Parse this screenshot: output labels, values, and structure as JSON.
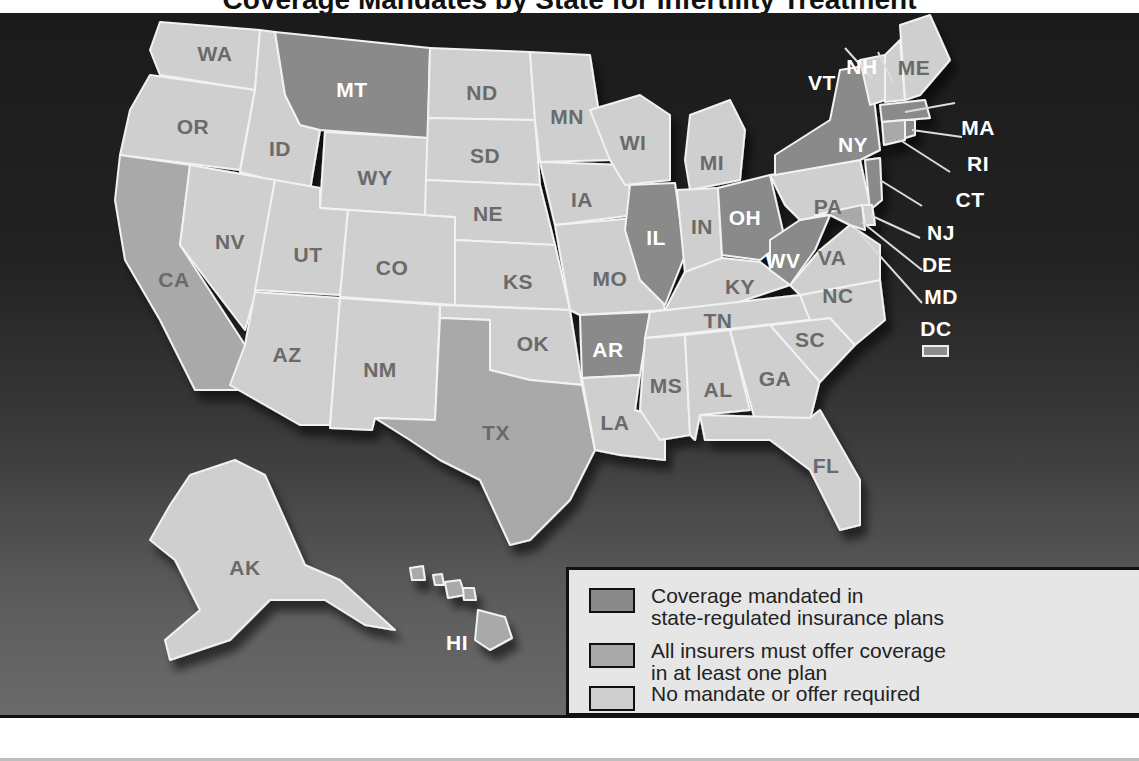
{
  "title": "Coverage Mandates by State for Infertility Treatment",
  "colors": {
    "mandated": "#8a8a8a",
    "offer": "#a9a9a9",
    "none": "#cfcfcf",
    "background_dark": "#1b1b1b",
    "legend_bg": "#e6e6e6"
  },
  "legend": {
    "items": [
      {
        "label": "Coverage mandated in state-regulated insurance plans",
        "line1": "Coverage mandated in",
        "line2": "state-regulated insurance plans",
        "category": "mandated"
      },
      {
        "label": "All insurers must offer coverage in at least one plan",
        "line1": "All insurers must offer coverage",
        "line2": "in at least one plan",
        "category": "offer"
      },
      {
        "label": "No mandate or offer required",
        "line1": "No mandate or offer required",
        "line2": "",
        "category": "none"
      }
    ]
  },
  "states": {
    "mandated": [
      "MT",
      "NY",
      "IL",
      "OH",
      "WV",
      "AR",
      "MA",
      "RI",
      "NJ"
    ],
    "offer": [
      "CA",
      "TX",
      "HI",
      "CT",
      "MD"
    ],
    "none": [
      "WA",
      "OR",
      "ID",
      "NV",
      "UT",
      "AZ",
      "WY",
      "CO",
      "NM",
      "ND",
      "SD",
      "NE",
      "KS",
      "OK",
      "MN",
      "IA",
      "MO",
      "LA",
      "WI",
      "MI",
      "IN",
      "KY",
      "TN",
      "MS",
      "AL",
      "GA",
      "FL",
      "SC",
      "NC",
      "VA",
      "PA",
      "DE",
      "VT",
      "NH",
      "ME",
      "AK",
      "DC"
    ]
  },
  "labels": {
    "WA": "WA",
    "OR": "OR",
    "ID": "ID",
    "MT": "MT",
    "WY": "WY",
    "NV": "NV",
    "CA": "CA",
    "UT": "UT",
    "CO": "CO",
    "AZ": "AZ",
    "NM": "NM",
    "ND": "ND",
    "SD": "SD",
    "NE": "NE",
    "KS": "KS",
    "OK": "OK",
    "TX": "TX",
    "MN": "MN",
    "IA": "IA",
    "MO": "MO",
    "AR": "AR",
    "LA": "LA",
    "WI": "WI",
    "IL": "IL",
    "MI": "MI",
    "IN": "IN",
    "OH": "OH",
    "KY": "KY",
    "TN": "TN",
    "MS": "MS",
    "AL": "AL",
    "GA": "GA",
    "FL": "FL",
    "SC": "SC",
    "NC": "NC",
    "VA": "VA",
    "WV": "WV",
    "PA": "PA",
    "NY": "NY",
    "VT": "VT",
    "NH": "NH",
    "ME": "ME",
    "MA": "MA",
    "RI": "RI",
    "CT": "CT",
    "NJ": "NJ",
    "DE": "DE",
    "MD": "MD",
    "DC": "DC",
    "AK": "AK",
    "HI": "HI"
  }
}
